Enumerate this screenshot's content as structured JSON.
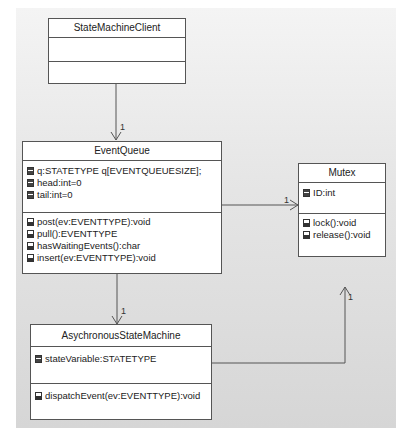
{
  "diagram": {
    "type": "UML class diagram",
    "classes": {
      "client": {
        "name": "StateMachineClient",
        "attributes": [],
        "operations": []
      },
      "queue": {
        "name": "EventQueue",
        "attributes": [
          "q:STATETYPE q[EVENTQUEUESIZE];",
          "head:int=0",
          "tail:int=0"
        ],
        "operations": [
          "post(ev:EVENTTYPE):void",
          "pull():EVENTTYPE",
          "hasWaitingEvents():char",
          "insert(ev:EVENTTYPE):void"
        ]
      },
      "mutex": {
        "name": "Mutex",
        "attributes": [
          "ID:int"
        ],
        "operations": [
          "lock():void",
          "release():void"
        ]
      },
      "machine": {
        "name": "AsychronousStateMachine",
        "attributes": [
          "stateVariable:STATETYPE"
        ],
        "operations": [
          "dispatchEvent(ev:EVENTTYPE):void"
        ]
      }
    },
    "associations": [
      {
        "from": "StateMachineClient",
        "to": "EventQueue",
        "multiplicity": "1"
      },
      {
        "from": "EventQueue",
        "to": "Mutex",
        "multiplicity": "1"
      },
      {
        "from": "EventQueue",
        "to": "AsychronousStateMachine",
        "multiplicity": "1"
      },
      {
        "from": "AsychronousStateMachine",
        "to": "Mutex",
        "multiplicity": "1"
      }
    ],
    "colors": {
      "line": "#555555",
      "box_fill": "#ffffff",
      "panel_top": "#f4f4f4",
      "panel_bottom": "#d6d6d6"
    }
  }
}
